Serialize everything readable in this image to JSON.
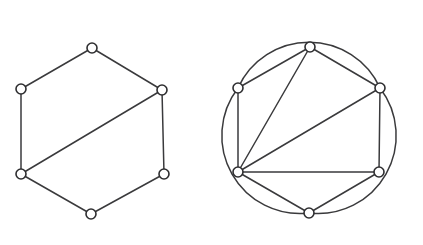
{
  "figure": {
    "title": "",
    "background_color": "#ffffff",
    "line_color": "#3a3a3c",
    "node_fill_color": "#ffffff",
    "node_stroke_color": "#2e2e30",
    "node_radius": 5,
    "stroke_width": 1.5,
    "caption": "",
    "panel_count": 2
  },
  "graphs": [
    {
      "id": "left-graph",
      "name": "hexagon-with-chord-graph",
      "label": "",
      "vertex_count": 6,
      "edge_count": 7,
      "nodes": [
        {
          "id": "L1",
          "label": "",
          "x": 92,
          "y": 48
        },
        {
          "id": "L2",
          "label": "",
          "x": 162,
          "y": 90
        },
        {
          "id": "L3",
          "label": "",
          "x": 164,
          "y": 174
        },
        {
          "id": "L4",
          "label": "",
          "x": 91,
          "y": 214
        },
        {
          "id": "L5",
          "label": "",
          "x": 21,
          "y": 174
        },
        {
          "id": "L6",
          "label": "",
          "x": 21,
          "y": 89
        }
      ],
      "edges": [
        {
          "from": "L1",
          "to": "L2",
          "type": "line"
        },
        {
          "from": "L2",
          "to": "L3",
          "type": "line"
        },
        {
          "from": "L3",
          "to": "L4",
          "type": "line"
        },
        {
          "from": "L4",
          "to": "L5",
          "type": "line"
        },
        {
          "from": "L5",
          "to": "L6",
          "type": "line"
        },
        {
          "from": "L6",
          "to": "L1",
          "type": "line"
        },
        {
          "from": "L2",
          "to": "L5",
          "type": "line"
        }
      ]
    },
    {
      "id": "right-graph",
      "name": "triangle-with-three-arcs-graph",
      "label": "",
      "vertex_count": 6,
      "edge_count": 9,
      "nodes": [
        {
          "id": "R1",
          "label": "",
          "x": 310,
          "y": 47
        },
        {
          "id": "R2",
          "label": "",
          "x": 380,
          "y": 88
        },
        {
          "id": "R3",
          "label": "",
          "x": 379,
          "y": 172
        },
        {
          "id": "R4",
          "label": "",
          "x": 309,
          "y": 213
        },
        {
          "id": "R5",
          "label": "",
          "x": 238,
          "y": 172
        },
        {
          "id": "R6",
          "label": "",
          "x": 238,
          "y": 88
        }
      ],
      "edges": [
        {
          "from": "R1",
          "to": "R2",
          "type": "line"
        },
        {
          "from": "R1",
          "to": "R6",
          "type": "line"
        },
        {
          "from": "R1",
          "to": "R5",
          "type": "line"
        },
        {
          "from": "R2",
          "to": "R3",
          "type": "line"
        },
        {
          "from": "R2",
          "to": "R5",
          "type": "line"
        },
        {
          "from": "R3",
          "to": "R4",
          "type": "line"
        },
        {
          "from": "R3",
          "to": "R5",
          "type": "line"
        },
        {
          "from": "R4",
          "to": "R5",
          "type": "line"
        },
        {
          "from": "R6",
          "to": "R5",
          "type": "line"
        }
      ],
      "arcs": [
        {
          "id": "arc-top",
          "from": "R6",
          "to": "R2",
          "radius": 78,
          "sweep": 1,
          "bulge": "up"
        },
        {
          "id": "arc-left",
          "from": "R4",
          "to": "R6",
          "radius": 78,
          "sweep": 1,
          "bulge": "left"
        },
        {
          "id": "arc-right",
          "from": "R2",
          "to": "R4",
          "radius": 78,
          "sweep": 1,
          "bulge": "right"
        }
      ]
    }
  ]
}
